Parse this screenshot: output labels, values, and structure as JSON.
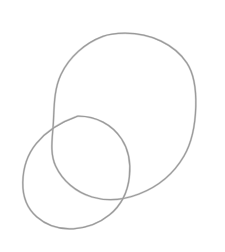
{
  "canvas": {
    "width": 225,
    "height": 252,
    "background_color": "#ffffff",
    "caption": "Two overlapping hand-drawn circles",
    "medium": "pencil sketch line drawing"
  },
  "style": {
    "stroke_color": "#9a9a9a",
    "stroke_halo_color": "#bdbdbd",
    "stroke_width": 1.25,
    "fill": "none"
  },
  "shapes": [
    {
      "name": "large-circle",
      "label": "Large circle",
      "center_x": 124.5,
      "center_y": 117.0,
      "radius_x": 71.5,
      "radius_y": 84.0,
      "bounds": {
        "left": 53,
        "top": 33,
        "right": 196,
        "bottom": 201
      },
      "rotation_deg": -4,
      "stroke_color": "#9a9a9a",
      "stroke_width": 1.25,
      "fill": "none",
      "path": "M 124.5 33.2 C 151.0 33.0 174.5 44.5 186.8 62.8 C 195.2 75.4 196.2 91.0 195.8 106.5 C 195.3 124.0 192.6 141.2 184.0 156.0 C 174.0 173.2 157.8 186.8 139.0 194.0 C 124.0 199.8 107.4 201.6 92.0 197.0 C 76.0 192.2 62.6 181.0 55.6 166.0 C 49.4 152.6 52.6 137.0 53.4 122.0 C 54.2 105.8 54.0 89.2 61.0 74.4 C 69.2 57.0 85.0 43.0 102.8 36.4 C 109.8 33.8 117.0 33.3 124.5 33.2 Z"
    },
    {
      "name": "small-circle",
      "label": "Small circle",
      "center_x": 76.5,
      "center_y": 172.5,
      "radius_x": 53.5,
      "radius_y": 56.5,
      "bounds": {
        "left": 23,
        "top": 116,
        "right": 130,
        "bottom": 229
      },
      "rotation_deg": 6,
      "stroke_color": "#9a9a9a",
      "stroke_width": 1.25,
      "fill": "none",
      "path": "M 78.0 116.2 C 96.0 116.0 112.2 124.6 121.6 139.0 C 128.8 150.0 130.8 163.6 129.4 176.6 C 127.8 191.4 121.0 205.4 109.6 214.8 C 99.6 223.0 86.4 228.0 73.4 228.8 C 60.2 229.6 46.6 225.6 36.6 216.8 C 27.0 208.4 22.6 195.4 22.8 182.6 C 23.0 168.6 27.4 154.4 36.4 143.4 C 46.2 131.4 61.0 122.0 76.0 116.8 C 76.6 116.5 77.3 116.3 78.0 116.2 Z"
    }
  ],
  "intersections": [
    {
      "name": "upper-left-intersection",
      "x": 55,
      "y": 120
    },
    {
      "name": "lower-right-intersection",
      "x": 128,
      "y": 196
    }
  ]
}
